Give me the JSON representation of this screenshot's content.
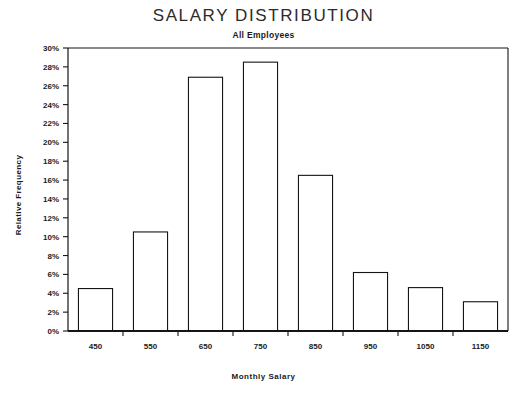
{
  "chart_data": {
    "type": "bar",
    "title": "SALARY DISTRIBUTION",
    "subtitle": "All Employees",
    "xlabel": "Monthly Salary",
    "ylabel": "Relative Frequency",
    "categories": [
      "450",
      "550",
      "650",
      "750",
      "850",
      "950",
      "1050",
      "1150"
    ],
    "values": [
      4.5,
      10.5,
      26.9,
      28.5,
      16.5,
      6.2,
      4.6,
      3.1
    ],
    "value_unit": "%",
    "ylim": [
      0,
      30
    ],
    "ytick_values": [
      0,
      2,
      4,
      6,
      8,
      10,
      12,
      14,
      16,
      18,
      20,
      22,
      24,
      26,
      28,
      30
    ],
    "ytick_labels": [
      "0%",
      "2%",
      "4%",
      "6%",
      "8%",
      "10%",
      "12%",
      "14%",
      "16%",
      "18%",
      "20%",
      "22%",
      "24%",
      "26%",
      "28%",
      "30%"
    ],
    "grid": false,
    "legend": null,
    "bar_style": "diagonal-hatch",
    "colors": {
      "bar_fill": "#ffffff",
      "bar_edge": "#151515",
      "axis": "#151515",
      "text": "#1a1a1a",
      "background": "#ffffff"
    }
  }
}
